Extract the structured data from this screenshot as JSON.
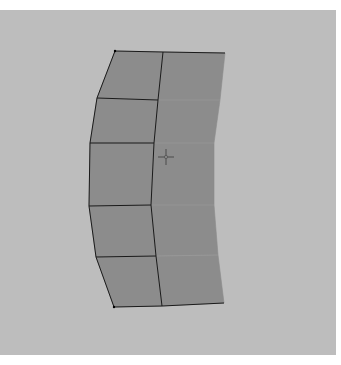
{
  "viewport": {
    "name": "3D modeling viewport",
    "background_color": "#bdbdbd",
    "mesh_fill_color": "#8c8c8c",
    "edge_color": "#1a1a1a"
  },
  "mesh": {
    "type": "curved plane grid",
    "columns": 2,
    "rows": 5,
    "vertices": {
      "left": [
        [
          115,
          51
        ],
        [
          97,
          98
        ],
        [
          90,
          143
        ],
        [
          89,
          206
        ],
        [
          96,
          257
        ],
        [
          114,
          307
        ]
      ],
      "middle": [
        [
          163,
          52
        ],
        [
          158,
          100
        ],
        [
          154,
          143
        ],
        [
          151,
          205
        ],
        [
          156,
          256
        ],
        [
          162,
          306
        ]
      ],
      "right": [
        [
          225,
          53
        ],
        [
          220,
          100
        ],
        [
          214,
          143
        ],
        [
          214,
          205
        ],
        [
          218,
          255
        ],
        [
          224,
          303
        ]
      ]
    }
  },
  "cursor": {
    "icon": "crosshair-icon",
    "x": 166,
    "y": 157
  }
}
